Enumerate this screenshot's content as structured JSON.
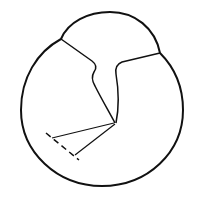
{
  "figure": {
    "width": 199,
    "height": 204,
    "background": "#ffffff",
    "stroke_color": "#111111",
    "outline": {
      "description": "outer contour of a rounded body with a smaller dome on top-right",
      "stroke_width": 2
    },
    "inner_lines": {
      "description": "two irregular dividing lines meeting at a central vertex",
      "stroke_width": 1.5
    },
    "angle_lines": {
      "description": "two straight lines radiating from the vertex toward the lower-left",
      "stroke_width": 1.2
    },
    "dashed_line": {
      "description": "dashed arc segment connecting the ends of the angle lines",
      "stroke_width": 1.5,
      "dash": "6 4"
    }
  }
}
